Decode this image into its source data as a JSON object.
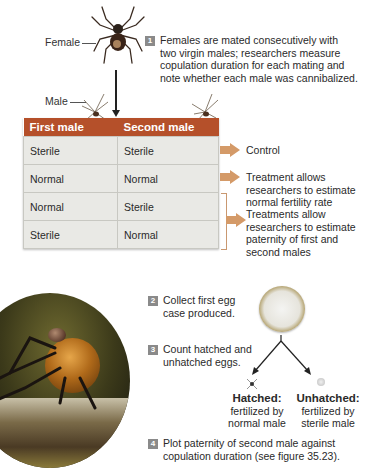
{
  "labels": {
    "female": "Female",
    "male": "Male"
  },
  "steps": [
    {
      "num": "1",
      "text_lines": [
        "Females are mated consecutively with",
        "two virgin males; researchers measure",
        "copulation duration for each mating and",
        "note whether each male was cannibalized."
      ]
    },
    {
      "num": "2",
      "text_lines": [
        "Collect first egg",
        "case produced."
      ]
    },
    {
      "num": "3",
      "text_lines": [
        "Count hatched and",
        "unhatched eggs."
      ]
    },
    {
      "num": "4",
      "text_lines": [
        "Plot paternity of second male against",
        "copulation duration (see figure 35.23)."
      ]
    }
  ],
  "table": {
    "headers": [
      "First male",
      "Second male"
    ],
    "rows": [
      [
        "Sterile",
        "Sterile"
      ],
      [
        "Normal",
        "Normal"
      ],
      [
        "Normal",
        "Sterile"
      ],
      [
        "Sterile",
        "Normal"
      ]
    ]
  },
  "outcomes": {
    "control": "Control",
    "normal_fertility": [
      "Treatment allows",
      "researchers to estimate",
      "normal fertility rate"
    ],
    "paternity": [
      "Treatments allow",
      "researchers to estimate",
      "paternity of first and",
      "second males"
    ]
  },
  "eggs": {
    "hatched": {
      "title": "Hatched:",
      "lines": [
        "fertilized by",
        "normal male"
      ]
    },
    "unhatched": {
      "title": "Unhatched:",
      "lines": [
        "fertilized by",
        "sterile male"
      ]
    }
  },
  "colors": {
    "table_header": "#b5502a",
    "table_cell": "#e9e9e5",
    "arrow": "#d49a68",
    "step_badge": "#8a8a8a"
  }
}
